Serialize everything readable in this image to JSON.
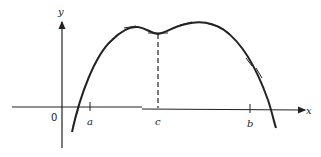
{
  "diagram": {
    "axes": {
      "x_label": "x",
      "y_label": "y",
      "origin_label": "0"
    },
    "points": [
      {
        "id": "a",
        "label": "a"
      },
      {
        "id": "c",
        "label": "c"
      },
      {
        "id": "b",
        "label": "b"
      }
    ]
  }
}
